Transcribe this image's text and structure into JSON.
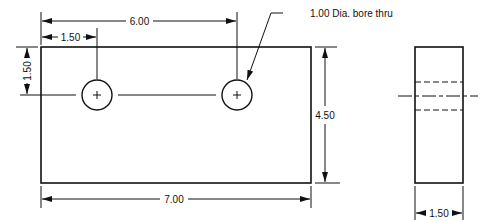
{
  "colors": {
    "line": "#111111",
    "background": "#ffffff"
  },
  "front_view": {
    "dimensions": {
      "hole_spacing_from_edge": "6.00",
      "first_hole_from_edge": "1.50",
      "hole_from_top": "1.50",
      "height": "4.50",
      "width": "7.00"
    },
    "note": "1.00 Dia. bore thru",
    "holes": [
      {
        "center_mark": "+"
      },
      {
        "center_mark": "+"
      }
    ]
  },
  "side_view": {
    "dimensions": {
      "thickness": "1.50"
    }
  }
}
